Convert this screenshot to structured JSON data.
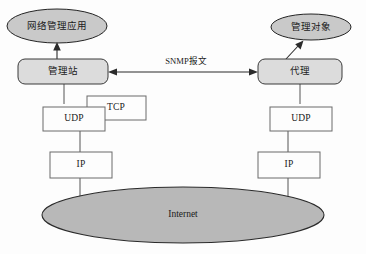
{
  "diagram": {
    "type": "network-architecture",
    "colors": {
      "ellipse_fill": "#c9c9c9",
      "internet_fill": "#b8b8b8",
      "round_rect_fill": "#dcdcdc",
      "rect_fill": "#fdfdfd",
      "stroke": "#2b2b2b",
      "background": "#fdfdfd"
    },
    "nodes": {
      "network_management_application": "网络管理应用",
      "management_station": "管理站",
      "managed_object": "管理对象",
      "agent": "代理",
      "tcp": "TCP",
      "udp_left": "UDP",
      "udp_right": "UDP",
      "ip_left": "IP",
      "ip_right": "IP",
      "internet": "Internet"
    },
    "links": {
      "snmp_message": "SNMP报文"
    }
  }
}
